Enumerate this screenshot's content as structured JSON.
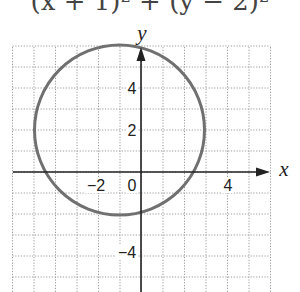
{
  "equation": {
    "text": "(x + 1)² + (y − 2)²",
    "cropped": true
  },
  "chart_data": {
    "type": "scatter",
    "title": "(x + 1)² + (y − 2)²",
    "shape": "circle",
    "center": [
      -1,
      2
    ],
    "radius": 4,
    "xlabel": "x",
    "ylabel": "y",
    "xlim": [
      -6,
      6
    ],
    "ylim": [
      -5.5,
      6
    ],
    "xticks": [
      {
        "value": -2,
        "label": "−2"
      },
      {
        "value": 0,
        "label": "0"
      },
      {
        "value": 4,
        "label": "4"
      }
    ],
    "yticks": [
      {
        "value": 4,
        "label": "4"
      },
      {
        "value": 2,
        "label": "2"
      },
      {
        "value": -4,
        "label": "−4"
      }
    ],
    "grid": true,
    "grid_style": "dotted",
    "curve_color": "#707070",
    "axis_color": "#222222"
  },
  "labels": {
    "x_axis": "x",
    "y_axis": "y",
    "tick_neg2": "−2",
    "tick_0": "0",
    "tick_4x": "4",
    "tick_4y": "4",
    "tick_2y": "2",
    "tick_neg4y": "−4"
  }
}
